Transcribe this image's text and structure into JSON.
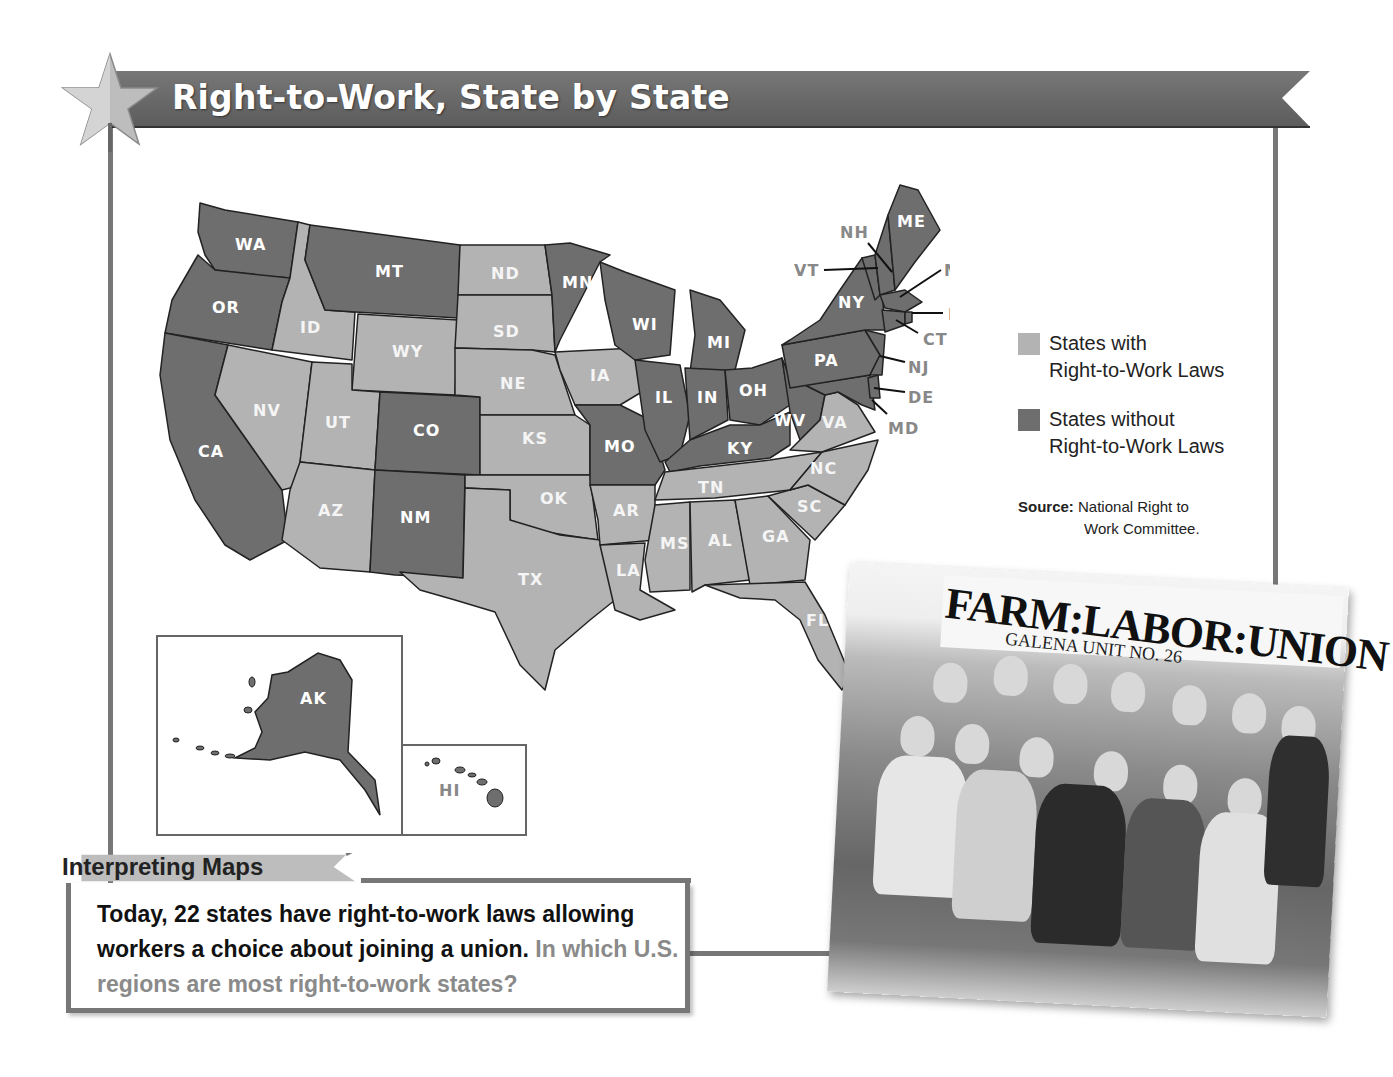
{
  "header": {
    "title": "Right-to-Work, State by State",
    "icon": "star-icon"
  },
  "colors": {
    "right_to_work": "#b3b3b3",
    "non_right_to_work": "#6e6e6e",
    "banner": "#6a6a6a",
    "frame": "#777777",
    "question_text": "#8a8a8a"
  },
  "legend": {
    "items": [
      {
        "label_line1": "States with",
        "label_line2": "Right-to-Work Laws",
        "color": "#b3b3b3"
      },
      {
        "label_line1": "States without",
        "label_line2": "Right-to-Work Laws",
        "color": "#6e6e6e"
      }
    ],
    "source_label": "Source:",
    "source_line1": "National Right to",
    "source_line2": "Work Committee."
  },
  "map": {
    "right_to_work_states": [
      "ID",
      "NV",
      "UT",
      "AZ",
      "WY",
      "ND",
      "SD",
      "NE",
      "KS",
      "OK",
      "TX",
      "IA",
      "AR",
      "LA",
      "MS",
      "AL",
      "TN",
      "GA",
      "SC",
      "NC",
      "VA",
      "FL"
    ],
    "non_right_to_work_states": [
      "WA",
      "OR",
      "CA",
      "MT",
      "CO",
      "NM",
      "MN",
      "WI",
      "MI",
      "IL",
      "IN",
      "OH",
      "KY",
      "WV",
      "MO",
      "PA",
      "NY",
      "VT",
      "NH",
      "ME",
      "MA",
      "RI",
      "CT",
      "NJ",
      "DE",
      "MD",
      "AK",
      "HI"
    ],
    "labels": {
      "WA": "WA",
      "OR": "OR",
      "CA": "CA",
      "ID": "ID",
      "NV": "NV",
      "MT": "MT",
      "WY": "WY",
      "UT": "UT",
      "AZ": "AZ",
      "CO": "CO",
      "NM": "NM",
      "ND": "ND",
      "SD": "SD",
      "NE": "NE",
      "KS": "KS",
      "OK": "OK",
      "TX": "TX",
      "MN": "MN",
      "IA": "IA",
      "MO": "MO",
      "AR": "AR",
      "LA": "LA",
      "WI": "WI",
      "IL": "IL",
      "MI": "MI",
      "IN": "IN",
      "OH": "OH",
      "KY": "KY",
      "TN": "TN",
      "MS": "MS",
      "AL": "AL",
      "GA": "GA",
      "FL": "FL",
      "SC": "SC",
      "NC": "NC",
      "VA": "VA",
      "WV": "WV",
      "PA": "PA",
      "NY": "NY",
      "ME": "ME",
      "NH": "NH",
      "VT": "VT",
      "MA": "MA",
      "RI": "RI",
      "CT": "CT",
      "NJ": "NJ",
      "DE": "DE",
      "MD": "MD",
      "AK": "AK",
      "HI": "HI"
    }
  },
  "interpreting": {
    "heading": "Interpreting Maps",
    "statement": "Today, 22 states have right-to-work laws allowing workers a choice about joining a union.",
    "question": "In which U.S. regions are most right-to-work states?"
  },
  "photo": {
    "banner_text": "FARM:LABOR:UNION",
    "sub_text": "GALENA UNIT NO. 26"
  }
}
